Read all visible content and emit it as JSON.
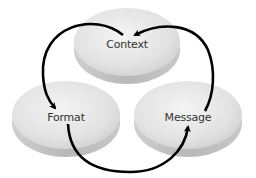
{
  "diagram": {
    "type": "cycle",
    "nodes": [
      {
        "id": "context",
        "label": "Context",
        "cx": 127,
        "cy": 42,
        "rx": 53,
        "ry": 34,
        "lx": 127,
        "ly": 44
      },
      {
        "id": "format",
        "label": "Format",
        "cx": 66,
        "cy": 115,
        "rx": 54,
        "ry": 34,
        "lx": 66,
        "ly": 117
      },
      {
        "id": "message",
        "label": "Message",
        "cx": 188,
        "cy": 115,
        "rx": 54,
        "ry": 34,
        "lx": 188,
        "ly": 117
      }
    ],
    "edges": [
      {
        "from": "context",
        "to": "format"
      },
      {
        "from": "format",
        "to": "message"
      },
      {
        "from": "message",
        "to": "context"
      }
    ],
    "colors": {
      "disc_top": "#e6e6e6",
      "disc_side": "#bdbdbd",
      "arrow": "#000000",
      "label": "#333333"
    }
  }
}
